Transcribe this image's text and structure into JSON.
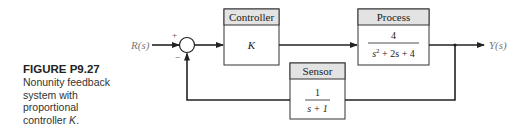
{
  "caption": {
    "title": "FIGURE P9.27",
    "lines": [
      "Nonunity feedback",
      "system with",
      "proportional",
      "controller "
    ],
    "italic_var": "K",
    "end": "."
  },
  "diagram": {
    "input_label": "R(s)",
    "output_label": "Y(s)",
    "sum_signs": {
      "plus": "+",
      "minus": "−"
    },
    "blocks": {
      "controller": {
        "header": "Controller",
        "body": "K"
      },
      "process": {
        "header": "Process",
        "numerator": "4",
        "denominator_parts": [
          "s",
          "2",
          " + 2s + 4"
        ]
      },
      "sensor": {
        "header": "Sensor",
        "numerator": "1",
        "denominator": "s + 1"
      }
    },
    "colors": {
      "line": "#222222",
      "header_fill": "#e3e3e3",
      "label": "#777777"
    }
  }
}
